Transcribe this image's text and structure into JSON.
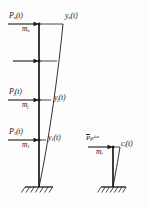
{
  "figure": {
    "background_color": "#fdfdfd",
    "line_color": "#1a1a1a",
    "width": 147,
    "height": 210
  },
  "main_frame": {
    "name": "multistory-cantilever-column",
    "column_x": 39,
    "top_y": 24,
    "base_y": 187,
    "support": "fixed-hatched-base",
    "levels": [
      {
        "id": "level-n",
        "y": 24,
        "force_label": "P",
        "force_sub": "n",
        "force_arg": "(t)",
        "mass_label": "m",
        "mass_sub": "n",
        "disp_label": "y",
        "disp_sub": "n",
        "disp_arg": "(t)",
        "has_force_label": true,
        "has_disp_label": true
      },
      {
        "id": "level-unlabeled",
        "y": 61,
        "force_label": "",
        "force_sub": "",
        "force_arg": "",
        "mass_label": "",
        "mass_sub": "",
        "disp_label": "",
        "disp_sub": "",
        "disp_arg": "",
        "has_force_label": false,
        "has_disp_label": false
      },
      {
        "id": "level-j",
        "y": 100,
        "force_label": "P",
        "force_sub": "j",
        "force_arg": "(t)",
        "mass_label": "m",
        "mass_sub": "j",
        "disp_label": "y",
        "disp_sub": "j",
        "disp_arg": "(t)",
        "has_force_label": true,
        "has_disp_label": true
      },
      {
        "id": "level-1",
        "y": 140,
        "force_label": "P",
        "force_sub": "1",
        "force_arg": "(t)",
        "mass_label": "m",
        "mass_sub": "1",
        "disp_label": "y",
        "disp_sub": "1",
        "disp_arg": "(t)",
        "has_force_label": true,
        "has_disp_label": true
      }
    ],
    "labels": {
      "P_n": "P",
      "P_n_sub": "n",
      "P_n_arg": "(t)",
      "m_n": "m",
      "m_n_sub": "n",
      "y_n": "y",
      "y_n_sub": "n",
      "y_n_arg": "(t)",
      "P_j": "P",
      "P_j_sub": "j",
      "P_j_arg": "(t)",
      "m_j": "m",
      "m_j_sub": "j",
      "y_j": "y",
      "y_j_sub": "j",
      "y_j_arg": "(t)",
      "P_1": "P",
      "P_1_sub": "1",
      "P_1_arg": "(t)",
      "m_1": "m",
      "m_1_sub": "1",
      "y_1": "y",
      "y_1_sub": "1",
      "y_1_arg": "(t)"
    }
  },
  "side_frame": {
    "name": "single-level-harmonic-load-column",
    "column_x": 113,
    "top_y": 147,
    "base_y": 187,
    "support": "fixed-hatched-base",
    "force_bar_label": "P",
    "force_sub": "i",
    "force_exp_base": "e",
    "force_exp_power": "iωt",
    "mass_label": "m",
    "mass_sub": "i",
    "disp_label": "c",
    "disp_sub": "i",
    "disp_arg": "(t)"
  }
}
